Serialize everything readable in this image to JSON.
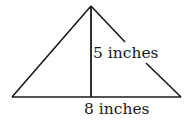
{
  "diagram": {
    "shape": "isosceles triangle with height",
    "height_label": "5 inches",
    "base_label": "8 inches",
    "stroke_color": "#1a1a1a",
    "background": "#ffffff"
  }
}
